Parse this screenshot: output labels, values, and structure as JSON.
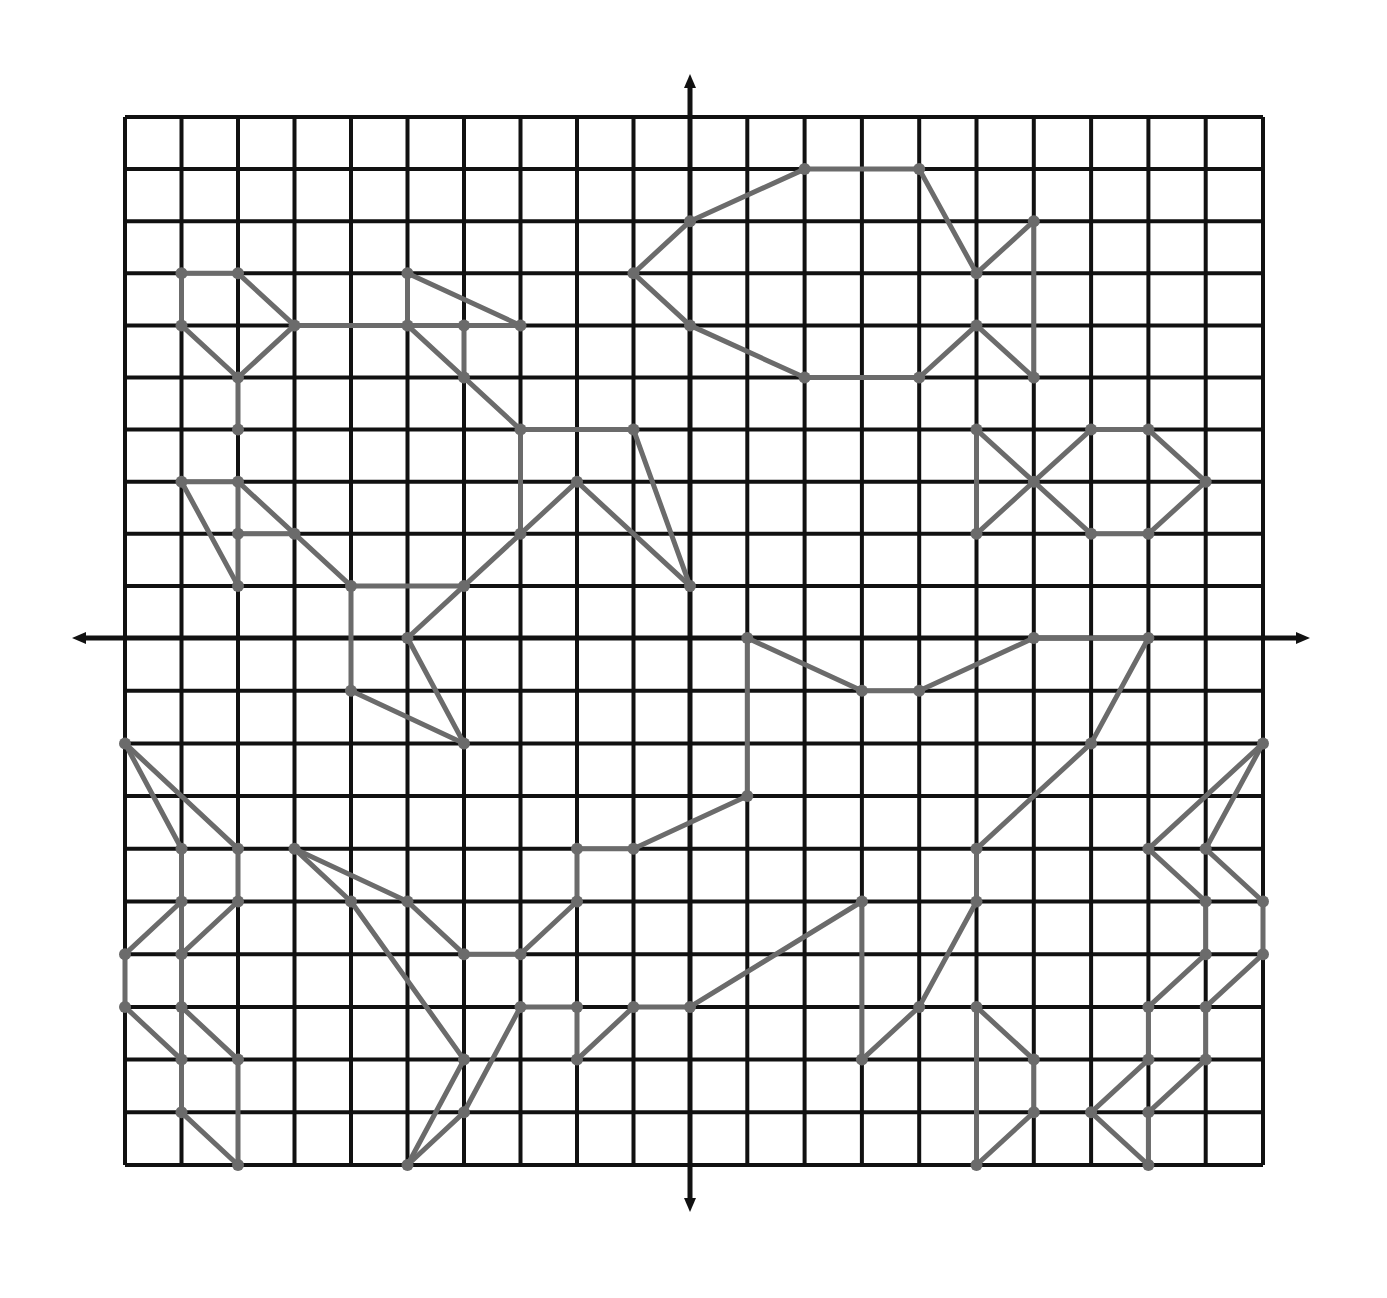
{
  "diagram": {
    "type": "coordinate-grid-line-art",
    "grid": {
      "xmin": -10,
      "xmax": 10,
      "ymin": -10,
      "ymax": 10,
      "step": 1
    },
    "axes": {
      "x_axis_arrows": true,
      "y_axis_arrows": true
    },
    "colors": {
      "grid": "#111111",
      "segments": "#6b6b6b",
      "background": "#ffffff"
    },
    "segments": [
      [
        [
          -1,
          7
        ],
        [
          0,
          8
        ]
      ],
      [
        [
          0,
          8
        ],
        [
          2,
          9
        ]
      ],
      [
        [
          2,
          9
        ],
        [
          4,
          9
        ]
      ],
      [
        [
          4,
          9
        ],
        [
          5,
          7
        ]
      ],
      [
        [
          5,
          7
        ],
        [
          6,
          8
        ]
      ],
      [
        [
          6,
          8
        ],
        [
          6,
          5
        ]
      ],
      [
        [
          -1,
          7
        ],
        [
          0,
          6
        ]
      ],
      [
        [
          0,
          6
        ],
        [
          2,
          5
        ]
      ],
      [
        [
          2,
          5
        ],
        [
          4,
          5
        ]
      ],
      [
        [
          4,
          5
        ],
        [
          5,
          6
        ]
      ],
      [
        [
          5,
          6
        ],
        [
          6,
          5
        ]
      ],
      [
        [
          5,
          4
        ],
        [
          6,
          3
        ]
      ],
      [
        [
          6,
          3
        ],
        [
          7,
          4
        ]
      ],
      [
        [
          7,
          4
        ],
        [
          8,
          4
        ]
      ],
      [
        [
          8,
          4
        ],
        [
          9,
          3
        ]
      ],
      [
        [
          9,
          3
        ],
        [
          8,
          2
        ]
      ],
      [
        [
          8,
          2
        ],
        [
          7,
          2
        ]
      ],
      [
        [
          7,
          2
        ],
        [
          6,
          3
        ]
      ],
      [
        [
          6,
          3
        ],
        [
          5,
          2
        ]
      ],
      [
        [
          5,
          2
        ],
        [
          5,
          4
        ]
      ],
      [
        [
          -9,
          7
        ],
        [
          -8,
          7
        ]
      ],
      [
        [
          -9,
          7
        ],
        [
          -9,
          6
        ]
      ],
      [
        [
          -8,
          7
        ],
        [
          -7,
          6
        ]
      ],
      [
        [
          -9,
          6
        ],
        [
          -8,
          5
        ]
      ],
      [
        [
          -8,
          5
        ],
        [
          -7,
          6
        ]
      ],
      [
        [
          -7,
          6
        ],
        [
          -5,
          6
        ]
      ],
      [
        [
          -5,
          6
        ],
        [
          -5,
          7
        ]
      ],
      [
        [
          -5,
          7
        ],
        [
          -3,
          6
        ]
      ],
      [
        [
          -5,
          6
        ],
        [
          -3,
          6
        ]
      ],
      [
        [
          -4,
          6
        ],
        [
          -4,
          5
        ]
      ],
      [
        [
          -5,
          6
        ],
        [
          -3,
          4
        ]
      ],
      [
        [
          -8,
          5
        ],
        [
          -8,
          4
        ]
      ],
      [
        [
          -3,
          4
        ],
        [
          -1,
          4
        ]
      ],
      [
        [
          -3,
          4
        ],
        [
          -3,
          2
        ]
      ],
      [
        [
          -1,
          4
        ],
        [
          0,
          1
        ]
      ],
      [
        [
          -2,
          3
        ],
        [
          0,
          1
        ]
      ],
      [
        [
          -2,
          3
        ],
        [
          -4,
          1
        ]
      ],
      [
        [
          -9,
          3
        ],
        [
          -8,
          3
        ]
      ],
      [
        [
          -9,
          3
        ],
        [
          -8,
          1
        ]
      ],
      [
        [
          -8,
          3
        ],
        [
          -8,
          1
        ]
      ],
      [
        [
          -8,
          2
        ],
        [
          -7,
          2
        ]
      ],
      [
        [
          -8,
          3
        ],
        [
          -6,
          1
        ]
      ],
      [
        [
          -6,
          1
        ],
        [
          -4,
          1
        ]
      ],
      [
        [
          -6,
          1
        ],
        [
          -6,
          -1
        ]
      ],
      [
        [
          -5,
          0
        ],
        [
          -4,
          1
        ]
      ],
      [
        [
          -5,
          0
        ],
        [
          -4,
          -2
        ]
      ],
      [
        [
          -6,
          -1
        ],
        [
          -4,
          -2
        ]
      ],
      [
        [
          -10,
          -2
        ],
        [
          -9,
          -4
        ]
      ],
      [
        [
          -10,
          -2
        ],
        [
          -8,
          -4
        ]
      ],
      [
        [
          -9,
          -4
        ],
        [
          -9,
          -9
        ]
      ],
      [
        [
          -8,
          -4
        ],
        [
          -8,
          -5
        ]
      ],
      [
        [
          -9,
          -5
        ],
        [
          -10,
          -6
        ]
      ],
      [
        [
          -8,
          -5
        ],
        [
          -9,
          -6
        ]
      ],
      [
        [
          -10,
          -6
        ],
        [
          -10,
          -7
        ]
      ],
      [
        [
          -10,
          -7
        ],
        [
          -9,
          -8
        ]
      ],
      [
        [
          -9,
          -7
        ],
        [
          -8,
          -8
        ]
      ],
      [
        [
          -8,
          -8
        ],
        [
          -8,
          -10
        ]
      ],
      [
        [
          -9,
          -9
        ],
        [
          -8,
          -10
        ]
      ],
      [
        [
          -7,
          -4
        ],
        [
          -5,
          -5
        ]
      ],
      [
        [
          -5,
          -5
        ],
        [
          -4,
          -6
        ]
      ],
      [
        [
          -7,
          -4
        ],
        [
          -6,
          -5
        ]
      ],
      [
        [
          -6,
          -5
        ],
        [
          -4,
          -8
        ]
      ],
      [
        [
          -4,
          -6
        ],
        [
          -3,
          -6
        ]
      ],
      [
        [
          -3,
          -6
        ],
        [
          -2,
          -5
        ]
      ],
      [
        [
          -2,
          -5
        ],
        [
          -2,
          -4
        ]
      ],
      [
        [
          -2,
          -4
        ],
        [
          -1,
          -4
        ]
      ],
      [
        [
          -1,
          -4
        ],
        [
          1,
          -3
        ]
      ],
      [
        [
          -3,
          -7
        ],
        [
          -2,
          -7
        ]
      ],
      [
        [
          -2,
          -7
        ],
        [
          -2,
          -8
        ]
      ],
      [
        [
          -2,
          -8
        ],
        [
          -1,
          -7
        ]
      ],
      [
        [
          -1,
          -7
        ],
        [
          0,
          -7
        ]
      ],
      [
        [
          -4,
          -8
        ],
        [
          -5,
          -10
        ]
      ],
      [
        [
          -5,
          -10
        ],
        [
          -4,
          -9
        ]
      ],
      [
        [
          -4,
          -9
        ],
        [
          -3,
          -7
        ]
      ],
      [
        [
          1,
          0
        ],
        [
          3,
          -1
        ]
      ],
      [
        [
          3,
          -1
        ],
        [
          4,
          -1
        ]
      ],
      [
        [
          4,
          -1
        ],
        [
          6,
          0
        ]
      ],
      [
        [
          6,
          0
        ],
        [
          8,
          0
        ]
      ],
      [
        [
          1,
          0
        ],
        [
          1,
          -3
        ]
      ],
      [
        [
          8,
          0
        ],
        [
          7,
          -2
        ]
      ],
      [
        [
          7,
          -2
        ],
        [
          5,
          -4
        ]
      ],
      [
        [
          5,
          -4
        ],
        [
          5,
          -5
        ]
      ],
      [
        [
          10,
          -2
        ],
        [
          8,
          -4
        ]
      ],
      [
        [
          10,
          -2
        ],
        [
          9,
          -4
        ]
      ],
      [
        [
          8,
          -4
        ],
        [
          9,
          -5
        ]
      ],
      [
        [
          9,
          -4
        ],
        [
          10,
          -5
        ]
      ],
      [
        [
          0,
          -7
        ],
        [
          3,
          -5
        ]
      ],
      [
        [
          3,
          -5
        ],
        [
          3,
          -8
        ]
      ],
      [
        [
          3,
          -8
        ],
        [
          4,
          -7
        ]
      ],
      [
        [
          4,
          -7
        ],
        [
          5,
          -5
        ]
      ],
      [
        [
          5,
          -7
        ],
        [
          5,
          -10
        ]
      ],
      [
        [
          5,
          -7
        ],
        [
          6,
          -8
        ]
      ],
      [
        [
          6,
          -8
        ],
        [
          6,
          -9
        ]
      ],
      [
        [
          6,
          -9
        ],
        [
          5,
          -10
        ]
      ],
      [
        [
          9,
          -5
        ],
        [
          9,
          -6
        ]
      ],
      [
        [
          10,
          -5
        ],
        [
          10,
          -6
        ]
      ],
      [
        [
          9,
          -6
        ],
        [
          8,
          -7
        ]
      ],
      [
        [
          8,
          -7
        ],
        [
          8,
          -8
        ]
      ],
      [
        [
          8,
          -8
        ],
        [
          7,
          -9
        ]
      ],
      [
        [
          10,
          -6
        ],
        [
          9,
          -7
        ]
      ],
      [
        [
          9,
          -7
        ],
        [
          9,
          -8
        ]
      ],
      [
        [
          9,
          -8
        ],
        [
          8,
          -9
        ]
      ],
      [
        [
          8,
          -9
        ],
        [
          8,
          -10
        ]
      ],
      [
        [
          7,
          -9
        ],
        [
          8,
          -10
        ]
      ]
    ]
  }
}
